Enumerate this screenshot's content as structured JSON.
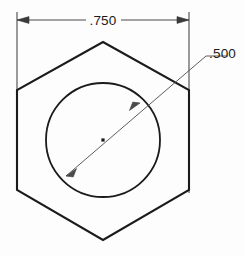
{
  "drawing": {
    "title": "Hex nut dimensioned sketch",
    "background_color": "#fdfdfd",
    "line_color": "#1b1b1b",
    "dimension_color": "#4a4a4a",
    "units": "inch",
    "views": [
      {
        "name": "top-view",
        "shape": "hexagon",
        "feature": "through-hole"
      }
    ]
  },
  "dimensions": {
    "width_across_flats": {
      "name": "width-dimension",
      "value": ".750",
      "type": "linear",
      "orientation": "horizontal",
      "placement": "above-part",
      "arrow_style": "outside-arrows"
    },
    "hole_diameter": {
      "name": "diameter-dimension",
      "value": ".500",
      "type": "diameter",
      "orientation": "diagonal-leader",
      "placement": "upper-right",
      "arrow_style": "inside-arrows"
    }
  },
  "geometry": {
    "hexagon": {
      "name": "hexagon-outline",
      "points": "103,42 189,90 189,190 103,240 17,190 17,90",
      "stroke_width": 2.1
    },
    "circle": {
      "name": "bore-circle",
      "cx": 103,
      "cy": 140,
      "r": 57,
      "stroke_width": 1.8
    },
    "center_mark": {
      "name": "center-point",
      "cx": 103,
      "cy": 140,
      "size": 3.2
    },
    "width_dim_line": {
      "left_x": 17,
      "right_x": 189,
      "y": 20,
      "text_x": 103,
      "gap_left": 86,
      "gap_right": 121
    },
    "extension_lines": {
      "left_x": 17,
      "right_x": 189,
      "top_y": 12,
      "left_bottom_y": 93,
      "right_bottom_y": 193
    },
    "leader": {
      "tip_x": 66,
      "tip_y": 176,
      "far_x": 140,
      "far_y": 103,
      "elbow_x": 206,
      "elbow_y": 56,
      "shoulder_x": 228,
      "shoulder_y": 56,
      "text_x": 209,
      "text_y": 58
    }
  },
  "labels": {
    "width_label": ".750",
    "diameter_label": ".500"
  }
}
